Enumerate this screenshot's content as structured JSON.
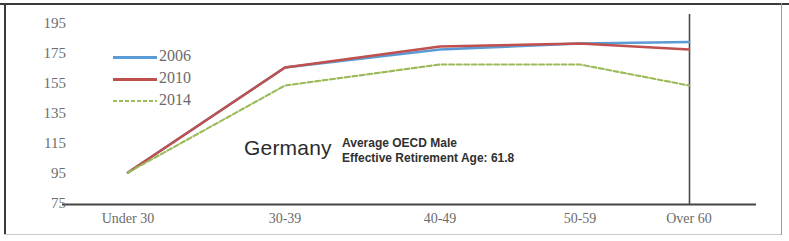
{
  "chart_data": {
    "type": "line",
    "title": "Germany",
    "xlabel": "",
    "ylabel": "",
    "categories": [
      "Under 30",
      "30-39",
      "40-49",
      "50-59",
      "Over 60"
    ],
    "series": [
      {
        "name": "2006",
        "color": "#5B9BD5",
        "style": "solid",
        "values": [
          96,
          166,
          178,
          182,
          183
        ]
      },
      {
        "name": "2010",
        "color": "#C0504D",
        "style": "solid",
        "values": [
          96,
          166,
          180,
          182,
          178
        ]
      },
      {
        "name": "2014",
        "color": "#9BBB59",
        "style": "dashed",
        "values": [
          96,
          154,
          168,
          168,
          154
        ]
      }
    ],
    "yticks": [
      195,
      175,
      155,
      135,
      115,
      95,
      75
    ],
    "ylim": [
      75,
      195
    ],
    "grid": false,
    "legend_position": "upper-left",
    "annotations": [
      {
        "text": "Germany"
      },
      {
        "text": "Average OECD Male"
      },
      {
        "text": "Effective Retirement Age: 61.8"
      }
    ]
  },
  "annotation": {
    "country": "Germany",
    "note_line1": "Average OECD Male",
    "note_line2": "Effective Retirement Age: 61.8"
  },
  "axis": {
    "y_labels": [
      "195",
      "175",
      "155",
      "135",
      "115",
      "95",
      "75"
    ],
    "x_labels": [
      "Under 30",
      "30-39",
      "40-49",
      "50-59",
      "Over 60"
    ]
  },
  "legend": {
    "items": [
      {
        "label": "2006",
        "color": "#5B9BD5"
      },
      {
        "label": "2010",
        "color": "#C0504D"
      },
      {
        "label": "2014",
        "color": "#9BBB59"
      }
    ]
  }
}
